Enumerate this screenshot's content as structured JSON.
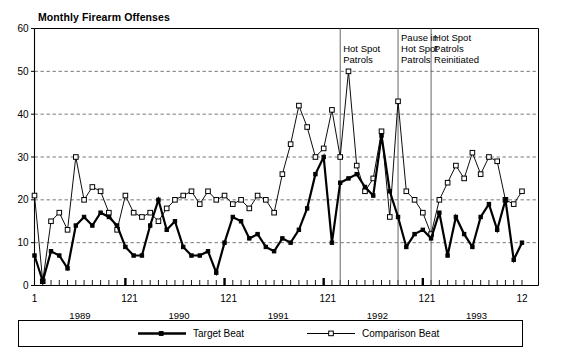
{
  "chart_data": {
    "type": "line",
    "title": "Monthly Firearm Offenses",
    "xlabel": "",
    "ylabel": "",
    "ylim": [
      0,
      60
    ],
    "ytick_values": [
      0,
      10,
      20,
      30,
      40,
      50,
      60
    ],
    "ytick_labels": [
      "0",
      "10",
      "20",
      "30",
      "40",
      "50",
      "60"
    ],
    "grid": "horizontal dashed gridlines at 10,20,30,40,50",
    "legend_position": "bottom",
    "xtick_labels": [
      "1",
      "12",
      "1",
      "12",
      "1",
      "12",
      "1",
      "12",
      "1",
      "12"
    ],
    "xtick_label_groups": [
      "1",
      "121",
      "121",
      "121",
      "121",
      "12"
    ],
    "year_labels": [
      "1989",
      "1990",
      "1991",
      "1992",
      "1993"
    ],
    "x": [
      1,
      2,
      3,
      4,
      5,
      6,
      7,
      8,
      9,
      10,
      11,
      12,
      13,
      14,
      15,
      16,
      17,
      18,
      19,
      20,
      21,
      22,
      23,
      24,
      25,
      26,
      27,
      28,
      29,
      30,
      31,
      32,
      33,
      34,
      35,
      36,
      37,
      38,
      39,
      40,
      41,
      42,
      43,
      44,
      45,
      46,
      47,
      48,
      49,
      50,
      51,
      52,
      53,
      54,
      55,
      56,
      57,
      58,
      59,
      60
    ],
    "series": [
      {
        "name": "Target Beat",
        "marker": "filled-square",
        "line": "thick-solid",
        "color": "#000000",
        "values": [
          7,
          1,
          8,
          7,
          4,
          14,
          16,
          14,
          17,
          16,
          14,
          9,
          7,
          7,
          14,
          20,
          13,
          15,
          9,
          7,
          7,
          8,
          3,
          10,
          16,
          15,
          11,
          12,
          9,
          8,
          11,
          10,
          13,
          18,
          26,
          30,
          10,
          24,
          25,
          26,
          23,
          21,
          35,
          22,
          16,
          9,
          12,
          13,
          11,
          17,
          7,
          16,
          12,
          9,
          16,
          19,
          13,
          20,
          6,
          10
        ]
      },
      {
        "name": "Comparison Beat",
        "marker": "open-square",
        "line": "thin-solid",
        "color": "#000000",
        "values": [
          21,
          1,
          15,
          17,
          13,
          30,
          20,
          23,
          22,
          17,
          13,
          21,
          17,
          16,
          17,
          15,
          18,
          20,
          21,
          22,
          19,
          22,
          20,
          21,
          19,
          20,
          18,
          21,
          20,
          17,
          26,
          33,
          42,
          37,
          30,
          32,
          41,
          30,
          50,
          28,
          22,
          25,
          36,
          16,
          43,
          22,
          20,
          17,
          12,
          20,
          24,
          28,
          25,
          31,
          26,
          30,
          29,
          20,
          19,
          22
        ]
      }
    ],
    "annotations": [
      {
        "label_lines": [
          "Hot Spot",
          "Patrols"
        ],
        "x_month": 38
      },
      {
        "label_lines": [
          "Pause in",
          "Hot Spot",
          "Patrols"
        ],
        "x_month": 45
      },
      {
        "label_lines": [
          "Hot Spot",
          "Patrols",
          "Reinitiated"
        ],
        "x_month": 49
      }
    ]
  },
  "legend": {
    "entries": [
      {
        "label": "Target Beat"
      },
      {
        "label": "Comparison Beat"
      }
    ]
  }
}
